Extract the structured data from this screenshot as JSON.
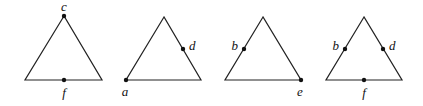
{
  "figure": {
    "triangles": [
      {
        "apex": [
          64,
          16
        ],
        "left": [
          25,
          80
        ],
        "right": [
          102,
          80
        ],
        "points": [
          {
            "label": "c",
            "at": [
              64,
              16
            ],
            "label_pos": [
              64,
              11
            ],
            "anchor": "middle"
          },
          {
            "label": "f",
            "at": [
              64,
              80
            ],
            "label_pos": [
              64,
              96
            ],
            "anchor": "middle"
          }
        ]
      },
      {
        "apex": [
          164,
          17
        ],
        "left": [
          126,
          80
        ],
        "right": [
          201,
          80
        ],
        "points": [
          {
            "label": "d",
            "at": [
              183,
              49
            ],
            "label_pos": [
              189,
              50
            ],
            "anchor": "start"
          },
          {
            "label": "a",
            "at": [
              126,
              80
            ],
            "label_pos": [
              125,
              96
            ],
            "anchor": "middle"
          }
        ]
      },
      {
        "apex": [
          263,
          17
        ],
        "left": [
          225,
          80
        ],
        "right": [
          301,
          80
        ],
        "points": [
          {
            "label": "b",
            "at": [
              244,
              49
            ],
            "label_pos": [
              237,
              50
            ],
            "anchor": "end"
          },
          {
            "label": "e",
            "at": [
              301,
              80
            ],
            "label_pos": [
              300,
              96
            ],
            "anchor": "middle"
          }
        ]
      },
      {
        "apex": [
          364,
          17
        ],
        "left": [
          326,
          80
        ],
        "right": [
          402,
          80
        ],
        "points": [
          {
            "label": "b",
            "at": [
              345,
              49
            ],
            "label_pos": [
              338,
              50
            ],
            "anchor": "end"
          },
          {
            "label": "d",
            "at": [
              383,
              49
            ],
            "label_pos": [
              389,
              50
            ],
            "anchor": "start"
          },
          {
            "label": "f",
            "at": [
              364,
              80
            ],
            "label_pos": [
              364,
              96
            ],
            "anchor": "middle"
          }
        ]
      }
    ]
  },
  "labels": {
    "t1_c": "c",
    "t1_f": "f",
    "t2_d": "d",
    "t2_a": "a",
    "t3_b": "b",
    "t3_e": "e",
    "t4_b": "b",
    "t4_d": "d",
    "t4_f": "f"
  }
}
